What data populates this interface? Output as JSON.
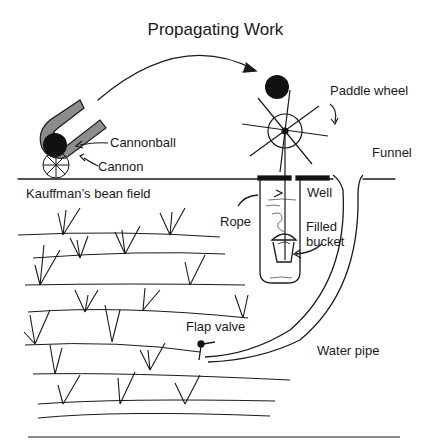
{
  "title": "Propagating Work",
  "labels": {
    "cannonball": "Cannonball",
    "cannon": "Cannon",
    "paddle_wheel": "Paddle wheel",
    "funnel": "Funnel",
    "bean_field": "Kauffman’s bean field",
    "well": "Well",
    "rope": "Rope",
    "filled_bucket_1": "Filled",
    "filled_bucket_2": "bucket",
    "flap_valve": "Flap valve",
    "water_pipe": "Water pipe"
  },
  "colors": {
    "ink": "#1a1a1a",
    "cannon_fill": "#8c8c8c",
    "background": "#ffffff"
  }
}
